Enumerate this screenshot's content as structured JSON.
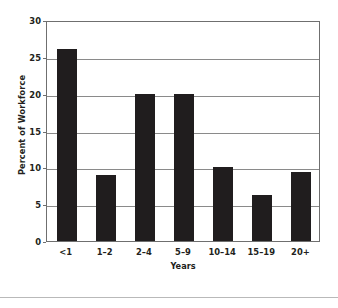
{
  "chart_data": {
    "type": "bar",
    "title": "",
    "xlabel": "Years",
    "ylabel": "Percent of Workforce",
    "categories": [
      "<1",
      "1–2",
      "2–4",
      "5–9",
      "10–14",
      "15–19",
      "20+"
    ],
    "values": [
      26,
      9,
      20,
      20,
      10,
      6.3,
      9.4
    ],
    "ylim": [
      0,
      30
    ],
    "yticks": [
      0,
      5,
      10,
      15,
      20,
      25,
      30
    ],
    "ytick_labels": [
      "0",
      "5",
      "10",
      "15",
      "20",
      "25",
      "30"
    ],
    "grid": "horizontal",
    "legend": "none",
    "bar_color": "#201d1e",
    "gridline_color": "#8a8a8a",
    "axis_color": "#6f6f6f",
    "background_color": "#ffffff"
  }
}
